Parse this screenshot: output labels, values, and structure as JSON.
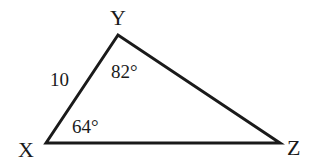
{
  "diagram": {
    "type": "triangle",
    "vertices": {
      "X": {
        "label": "X"
      },
      "Y": {
        "label": "Y"
      },
      "Z": {
        "label": "Z"
      }
    },
    "side_labels": {
      "XY": "10"
    },
    "angle_labels": {
      "Y": "82°",
      "X": "64°"
    },
    "stroke_color": "#1a1a1a",
    "background": "#ffffff"
  }
}
